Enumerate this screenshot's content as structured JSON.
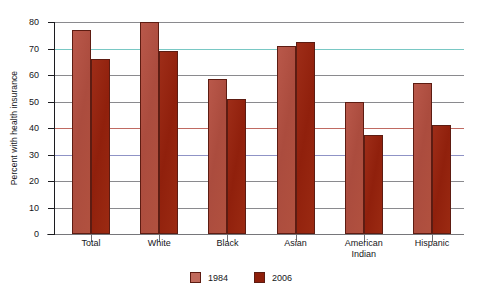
{
  "chart_data": {
    "type": "bar",
    "title": "",
    "xlabel": "",
    "ylabel": "Percent with health insurance",
    "ylim": [
      0,
      80
    ],
    "ytick_step": 10,
    "grid": true,
    "legend_position": "bottom-center",
    "categories": [
      "Total",
      "White",
      "Black",
      "Asian",
      "American Indian",
      "Hispanic"
    ],
    "category_lines": [
      [
        "Total"
      ],
      [
        "White"
      ],
      [
        "Black"
      ],
      [
        "Asian"
      ],
      [
        "American",
        "Indian"
      ],
      [
        "Hispanic"
      ]
    ],
    "yticks": [
      0,
      10,
      20,
      30,
      40,
      50,
      60,
      70,
      80
    ],
    "series": [
      {
        "name": "1984",
        "color": "#b1513f",
        "values": [
          77,
          80,
          58.5,
          71,
          50,
          57
        ]
      },
      {
        "name": "2006",
        "color": "#9b2a12",
        "values": [
          66,
          69,
          51,
          72.5,
          37.5,
          41
        ]
      }
    ]
  },
  "legend": {
    "items": [
      {
        "label": "1984"
      },
      {
        "label": "2006"
      }
    ]
  }
}
